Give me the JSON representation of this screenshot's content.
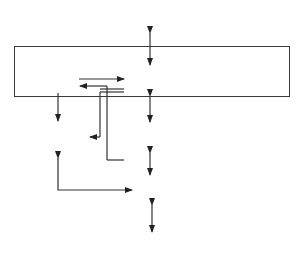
{
  "diagram": {
    "type": "block-diagram",
    "system_title": "KNOWLEDGE-BASED\nSYSTEM",
    "external": {
      "expert": "EXPERT",
      "user": "USER"
    },
    "components": {
      "working_memory": "Working\nmemory",
      "knowledge_base": "Knowledge\nbase",
      "explanation_subsystem": "Explanation\nsubsystem",
      "reasoning_engine": "Reasoning\nengine",
      "user_interface": "User\ninterface"
    },
    "connections": [
      {
        "from": "EXPERT",
        "to": "Knowledge base",
        "direction": "bidirectional"
      },
      {
        "from": "Working memory",
        "to": "Knowledge base",
        "direction": "one-way"
      },
      {
        "from": "Knowledge base",
        "to": "Working memory",
        "direction": "one-way"
      },
      {
        "from": "Working memory",
        "to": "Explanation subsystem",
        "direction": "one-way"
      },
      {
        "from": "Knowledge base",
        "to": "Explanation subsystem",
        "direction": "one-way"
      },
      {
        "from": "Reasoning engine",
        "to": "Working memory",
        "direction": "one-way"
      },
      {
        "from": "Knowledge base",
        "to": "Reasoning engine",
        "direction": "bidirectional"
      },
      {
        "from": "Reasoning engine",
        "to": "User interface",
        "direction": "bidirectional"
      },
      {
        "from": "Explanation subsystem",
        "to": "User interface",
        "direction": "bidirectional"
      },
      {
        "from": "User interface",
        "to": "USER",
        "direction": "bidirectional"
      }
    ]
  }
}
